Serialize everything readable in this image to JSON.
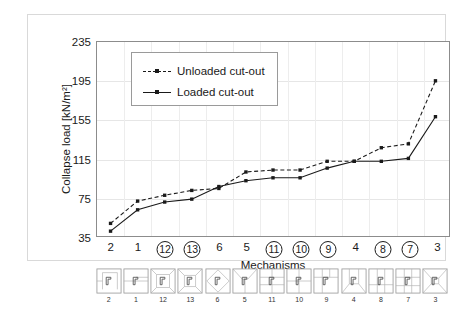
{
  "chart_data": {
    "type": "line",
    "title": "",
    "xlabel": "Mechanisms",
    "ylabel": "Collapse load [kN/m²]",
    "ylim": [
      35,
      235
    ],
    "yticks": [
      35,
      75,
      115,
      155,
      195,
      235
    ],
    "grid": true,
    "legend_position": "upper-left-inside",
    "categories": [
      "2",
      "1",
      "12",
      "13",
      "6",
      "5",
      "11",
      "10",
      "9",
      "4",
      "8",
      "7",
      "3"
    ],
    "categories_circled": [
      false,
      false,
      true,
      true,
      false,
      false,
      true,
      true,
      true,
      false,
      true,
      true,
      false
    ],
    "series": [
      {
        "name": "Unloaded cut-out",
        "style": "dashed",
        "marker": "square",
        "color": "#1a1a1a",
        "values": [
          48,
          71,
          77,
          82,
          84,
          101,
          103,
          103,
          112,
          112,
          126,
          130,
          195
        ]
      },
      {
        "name": "Loaded cut-out",
        "style": "solid",
        "marker": "square",
        "color": "#1a1a1a",
        "values": [
          40,
          62,
          70,
          73,
          86,
          92,
          95,
          95,
          105,
          112,
          112,
          115,
          158
        ]
      }
    ]
  },
  "legend": {
    "items": [
      {
        "label": "Unloaded cut-out",
        "style": "dashed"
      },
      {
        "label": "Loaded cut-out",
        "style": "solid"
      }
    ]
  },
  "mechanism_strip": {
    "items": [
      {
        "num": "2",
        "icon": "mechanism-2-icon"
      },
      {
        "num": "1",
        "icon": "mechanism-1-icon"
      },
      {
        "num": "12",
        "icon": "mechanism-12-icon"
      },
      {
        "num": "13",
        "icon": "mechanism-13-icon"
      },
      {
        "num": "6",
        "icon": "mechanism-6-icon"
      },
      {
        "num": "5",
        "icon": "mechanism-5-icon"
      },
      {
        "num": "11",
        "icon": "mechanism-11-icon"
      },
      {
        "num": "10",
        "icon": "mechanism-10-icon"
      },
      {
        "num": "9",
        "icon": "mechanism-9-icon"
      },
      {
        "num": "4",
        "icon": "mechanism-4-icon"
      },
      {
        "num": "8",
        "icon": "mechanism-8-icon"
      },
      {
        "num": "7",
        "icon": "mechanism-7-icon"
      },
      {
        "num": "3",
        "icon": "mechanism-3-icon"
      }
    ]
  },
  "colors": {
    "line": "#1a1a1a",
    "grid": "#e6e6e6",
    "axis": "#8c8c8c",
    "frame": "#d9d9d9",
    "background": "#ffffff"
  }
}
